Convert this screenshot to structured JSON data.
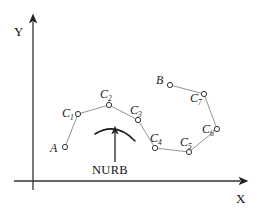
{
  "figure": {
    "background": "#ffffff",
    "width": 263,
    "height": 215,
    "stroke_color": "#555555",
    "axis_color": "#333333",
    "marker_color": "#333333"
  },
  "axes": {
    "x_label": "X",
    "y_label": "Y",
    "origin": [
      33,
      181
    ],
    "x_end": [
      245,
      181
    ],
    "y_end": [
      33,
      16
    ],
    "x_label_pos": [
      236,
      203
    ],
    "y_label_pos": [
      14,
      36
    ]
  },
  "annotation": {
    "curve_label": "NURB",
    "curve_label_pos": [
      92,
      174
    ],
    "arrow_tail": [
      115,
      162
    ],
    "arrow_head": [
      115,
      131
    ],
    "arc_start": [
      95,
      134
    ],
    "arc_ctrl": [
      116,
      121
    ],
    "arc_end": [
      135,
      141
    ]
  },
  "chart_data": {
    "type": "scatter",
    "title": "",
    "xlabel": "X",
    "ylabel": "Y",
    "grid": false,
    "legend": "none",
    "annotations": [
      "NURB"
    ],
    "points": [
      {
        "id": "A",
        "label": "A",
        "sub": "",
        "x": 65,
        "y": 147,
        "label_x": 50,
        "label_y": 152,
        "sub_x": 0,
        "sub_y": 0
      },
      {
        "id": "C1",
        "label": "C",
        "sub": "1",
        "x": 78,
        "y": 114,
        "label_x": 62,
        "label_y": 117,
        "sub_x": 70,
        "sub_y": 120
      },
      {
        "id": "C2",
        "label": "C",
        "sub": "2",
        "x": 109,
        "y": 105,
        "label_x": 100,
        "label_y": 98,
        "sub_x": 108,
        "sub_y": 101
      },
      {
        "id": "C3",
        "label": "C",
        "sub": "3",
        "x": 138,
        "y": 120,
        "label_x": 130,
        "label_y": 114,
        "sub_x": 138,
        "sub_y": 117
      },
      {
        "id": "C4",
        "label": "C",
        "sub": "4",
        "x": 155,
        "y": 148,
        "label_x": 150,
        "label_y": 142,
        "sub_x": 158,
        "sub_y": 145
      },
      {
        "id": "C5",
        "label": "C",
        "sub": "5",
        "x": 189,
        "y": 152,
        "label_x": 180,
        "label_y": 146,
        "sub_x": 188,
        "sub_y": 149
      },
      {
        "id": "C6",
        "label": "C",
        "sub": "6",
        "x": 217,
        "y": 129,
        "label_x": 202,
        "label_y": 133,
        "sub_x": 210,
        "sub_y": 136
      },
      {
        "id": "C7",
        "label": "C",
        "sub": "7",
        "x": 204,
        "y": 94,
        "label_x": 190,
        "label_y": 102,
        "sub_x": 198,
        "sub_y": 105
      },
      {
        "id": "B",
        "label": "B",
        "sub": "",
        "x": 170,
        "y": 85,
        "label_x": 156,
        "label_y": 84,
        "sub_x": 0,
        "sub_y": 0
      }
    ],
    "polyline_order": [
      "A",
      "C1",
      "C2",
      "C3",
      "C4",
      "C5",
      "C6",
      "C7",
      "B"
    ]
  }
}
